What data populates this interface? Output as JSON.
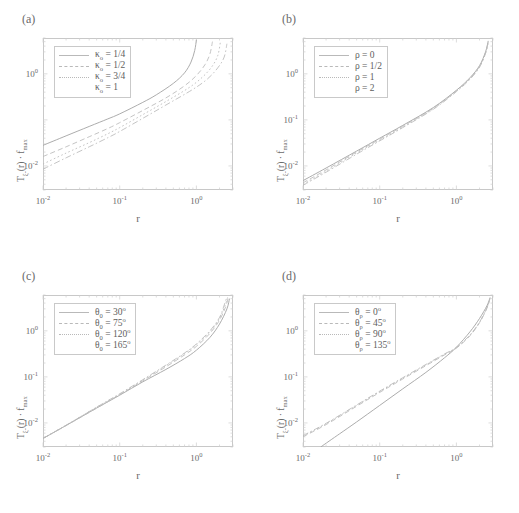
{
  "figure": {
    "background": "#ffffff",
    "line_color": "#b9b9b9",
    "solid_color": "#a8a8a8",
    "frame_color": "#c8c8c8"
  },
  "axis": {
    "xlabel": "r",
    "ylabel_prefix": "T",
    "ylabel_sub": "ξ-",
    "ylabel_mid": "(r) · f",
    "ylabel_sub2": "max",
    "xticks": [
      "10",
      "10",
      "10"
    ],
    "xtick_exp": [
      "-2",
      "-1",
      "0"
    ],
    "yticks": [
      "10",
      "10",
      "10"
    ],
    "ytick_exp": [
      "0",
      "-1",
      "-2"
    ]
  },
  "panels": [
    {
      "id": "a",
      "label": "(a)",
      "legend": [
        {
          "symbol": "κ",
          "sub": "o",
          "value": "1/4",
          "style": "solid"
        },
        {
          "symbol": "κ",
          "sub": "o",
          "value": "1/2",
          "style": "dashed"
        },
        {
          "symbol": "κ",
          "sub": "o",
          "value": "3/4",
          "style": "dotted"
        },
        {
          "symbol": "κ",
          "sub": "o",
          "value": "1",
          "style": "dashdot"
        }
      ],
      "show_ytick_minus1": false
    },
    {
      "id": "b",
      "label": "(b)",
      "legend": [
        {
          "symbol": "ρ",
          "sub": "",
          "value": "0",
          "style": "solid"
        },
        {
          "symbol": "ρ",
          "sub": "",
          "value": "1/2",
          "style": "dashed"
        },
        {
          "symbol": "ρ",
          "sub": "",
          "value": "1",
          "style": "dotted"
        },
        {
          "symbol": "ρ",
          "sub": "",
          "value": "2",
          "style": "dashdot"
        }
      ],
      "show_ytick_minus1": true
    },
    {
      "id": "c",
      "label": "(c)",
      "legend": [
        {
          "symbol": "θ",
          "sub": "0",
          "value": "30°",
          "style": "solid"
        },
        {
          "symbol": "θ",
          "sub": "0",
          "value": "75°",
          "style": "dashed"
        },
        {
          "symbol": "θ",
          "sub": "0",
          "value": "120°",
          "style": "dotted"
        },
        {
          "symbol": "θ",
          "sub": "0",
          "value": "165°",
          "style": "dashdot"
        }
      ],
      "show_ytick_minus1": true
    },
    {
      "id": "d",
      "label": "(d)",
      "legend": [
        {
          "symbol": "θ",
          "sub": "ρ",
          "value": "0°",
          "style": "solid"
        },
        {
          "symbol": "θ",
          "sub": "ρ",
          "value": "45°",
          "style": "dashed"
        },
        {
          "symbol": "θ",
          "sub": "ρ",
          "value": "90°",
          "style": "dotted"
        },
        {
          "symbol": "θ",
          "sub": "ρ",
          "value": "135°",
          "style": "dashdot"
        }
      ],
      "show_ytick_minus1": true
    }
  ],
  "chart_data": {
    "type": "line",
    "layout": "2x2 grid of log-log plots",
    "xlabel": "r",
    "ylabel": "T_ξ-(r) · f_max",
    "xscale": "log",
    "yscale": "log",
    "xlim": [
      0.01,
      3.0
    ],
    "ylim": [
      0.003,
      6.0
    ],
    "xticks": [
      0.01,
      0.1,
      1.0
    ],
    "yticks": [
      0.01,
      0.1,
      1.0
    ],
    "grid": false,
    "legend_position": "upper-left",
    "panels": [
      {
        "id": "a",
        "title": "(a)",
        "parameter": "kappa_0",
        "series": [
          {
            "name": "κ_o = 1/4",
            "style": "solid",
            "x": [
              0.01,
              0.02,
              0.04,
              0.07,
              0.1,
              0.2,
              0.3,
              0.5,
              0.7,
              0.85,
              0.95,
              1.0
            ],
            "y": [
              0.028,
              0.045,
              0.072,
              0.105,
              0.135,
              0.24,
              0.35,
              0.62,
              1.05,
              1.8,
              3.2,
              5.5
            ]
          },
          {
            "name": "κ_o = 1/2",
            "style": "dashed",
            "x": [
              0.01,
              0.02,
              0.04,
              0.07,
              0.1,
              0.2,
              0.4,
              0.7,
              1.0,
              1.3,
              1.5,
              1.62
            ],
            "y": [
              0.016,
              0.026,
              0.043,
              0.065,
              0.087,
              0.16,
              0.3,
              0.55,
              0.92,
              1.6,
              2.7,
              5.0
            ]
          },
          {
            "name": "κ_o = 3/4",
            "style": "dotted",
            "x": [
              0.01,
              0.02,
              0.04,
              0.07,
              0.1,
              0.2,
              0.4,
              0.8,
              1.2,
              1.6,
              1.9,
              2.05
            ],
            "y": [
              0.011,
              0.019,
              0.032,
              0.05,
              0.068,
              0.13,
              0.25,
              0.5,
              0.85,
              1.45,
              2.5,
              4.8
            ]
          },
          {
            "name": "κ_o = 1",
            "style": "dashdot",
            "x": [
              0.01,
              0.02,
              0.04,
              0.07,
              0.1,
              0.2,
              0.4,
              0.9,
              1.4,
              1.9,
              2.3,
              2.5
            ],
            "y": [
              0.0085,
              0.015,
              0.026,
              0.041,
              0.056,
              0.108,
              0.21,
              0.46,
              0.78,
              1.35,
              2.3,
              4.5
            ]
          }
        ]
      },
      {
        "id": "b",
        "title": "(b)",
        "parameter": "rho",
        "note": "four curves nearly coincident, slight separation at mid-r, all diverge near r=2.5",
        "series": [
          {
            "name": "ρ = 0",
            "style": "solid",
            "x": [
              0.01,
              0.02,
              0.05,
              0.1,
              0.2,
              0.5,
              1.0,
              1.5,
              2.0,
              2.4,
              2.6
            ],
            "y": [
              0.0048,
              0.009,
              0.021,
              0.04,
              0.076,
              0.185,
              0.44,
              0.82,
              1.5,
              3.0,
              5.2
            ]
          },
          {
            "name": "ρ = 1/2",
            "style": "dashed",
            "x": [
              0.01,
              0.02,
              0.05,
              0.1,
              0.2,
              0.5,
              1.0,
              1.5,
              2.0,
              2.4,
              2.6
            ],
            "y": [
              0.0043,
              0.0082,
              0.02,
              0.038,
              0.073,
              0.18,
              0.43,
              0.8,
              1.45,
              2.9,
              5.0
            ]
          },
          {
            "name": "ρ = 1",
            "style": "dotted",
            "x": [
              0.01,
              0.02,
              0.05,
              0.1,
              0.2,
              0.5,
              1.0,
              1.5,
              2.0,
              2.4,
              2.6
            ],
            "y": [
              0.004,
              0.0077,
              0.019,
              0.036,
              0.07,
              0.175,
              0.42,
              0.78,
              1.42,
              2.85,
              4.9
            ]
          },
          {
            "name": "ρ = 2",
            "style": "dashdot",
            "x": [
              0.01,
              0.02,
              0.05,
              0.1,
              0.2,
              0.5,
              1.0,
              1.5,
              2.0,
              2.4,
              2.6
            ],
            "y": [
              0.0038,
              0.0073,
              0.018,
              0.035,
              0.068,
              0.17,
              0.41,
              0.76,
              1.38,
              2.8,
              4.8
            ]
          }
        ]
      },
      {
        "id": "c",
        "title": "(c)",
        "parameter": "theta_0",
        "note": "curves coincide below r=0.2, separate above; solid (30°) lowest at large r",
        "series": [
          {
            "name": "θ_0 = 30°",
            "style": "solid",
            "x": [
              0.01,
              0.02,
              0.05,
              0.1,
              0.2,
              0.4,
              0.7,
              1.0,
              1.5,
              2.0,
              2.5,
              2.7
            ],
            "y": [
              0.0046,
              0.0088,
              0.021,
              0.04,
              0.078,
              0.145,
              0.25,
              0.38,
              0.72,
              1.4,
              3.0,
              5.0
            ]
          },
          {
            "name": "θ_0 = 75°",
            "style": "dashed",
            "x": [
              0.01,
              0.02,
              0.05,
              0.1,
              0.2,
              0.4,
              0.7,
              1.0,
              1.5,
              2.0,
              2.4,
              2.6
            ],
            "y": [
              0.0046,
              0.0088,
              0.021,
              0.041,
              0.082,
              0.165,
              0.3,
              0.46,
              0.88,
              1.7,
              3.3,
              5.2
            ]
          },
          {
            "name": "θ_0 = 120°",
            "style": "dotted",
            "x": [
              0.01,
              0.02,
              0.05,
              0.1,
              0.2,
              0.4,
              0.7,
              1.0,
              1.5,
              2.0,
              2.35,
              2.55
            ],
            "y": [
              0.0046,
              0.0089,
              0.022,
              0.042,
              0.085,
              0.175,
              0.32,
              0.5,
              0.95,
              1.85,
              3.5,
              5.3
            ]
          },
          {
            "name": "θ_0 = 165°",
            "style": "dashdot",
            "x": [
              0.01,
              0.02,
              0.05,
              0.1,
              0.2,
              0.4,
              0.7,
              1.0,
              1.5,
              2.0,
              2.3,
              2.5
            ],
            "y": [
              0.0046,
              0.0089,
              0.022,
              0.043,
              0.087,
              0.18,
              0.33,
              0.52,
              1.0,
              1.95,
              3.6,
              5.4
            ]
          }
        ]
      },
      {
        "id": "d",
        "title": "(d)",
        "parameter": "theta_rho",
        "note": "solid (0°) starts much lower, crosses the dashed group near r=1.2",
        "series": [
          {
            "name": "θ_ρ = 0°",
            "style": "solid",
            "x": [
              0.017,
              0.03,
              0.05,
              0.1,
              0.2,
              0.4,
              0.7,
              1.0,
              1.5,
              2.0,
              2.5,
              2.75
            ],
            "y": [
              0.003,
              0.0058,
              0.0105,
              0.024,
              0.055,
              0.125,
              0.26,
              0.44,
              0.95,
              1.85,
              3.5,
              5.3
            ]
          },
          {
            "name": "θ_ρ = 45°",
            "style": "dashed",
            "x": [
              0.01,
              0.02,
              0.05,
              0.1,
              0.2,
              0.4,
              0.7,
              1.0,
              1.5,
              2.0,
              2.5,
              2.75
            ],
            "y": [
              0.005,
              0.0092,
              0.023,
              0.046,
              0.09,
              0.175,
              0.3,
              0.42,
              0.78,
              1.5,
              3.1,
              5.1
            ]
          },
          {
            "name": "θ_ρ = 90°",
            "style": "dotted",
            "x": [
              0.01,
              0.02,
              0.05,
              0.1,
              0.2,
              0.4,
              0.7,
              1.0,
              1.5,
              2.0,
              2.5,
              2.75
            ],
            "y": [
              0.0052,
              0.0096,
              0.024,
              0.048,
              0.094,
              0.182,
              0.31,
              0.43,
              0.8,
              1.52,
              3.15,
              5.15
            ]
          },
          {
            "name": "θ_ρ = 135°",
            "style": "dashdot",
            "x": [
              0.01,
              0.02,
              0.05,
              0.1,
              0.2,
              0.4,
              0.7,
              1.0,
              1.5,
              2.0,
              2.5,
              2.75
            ],
            "y": [
              0.0053,
              0.0098,
              0.0245,
              0.049,
              0.096,
              0.186,
              0.315,
              0.435,
              0.81,
              1.54,
              3.18,
              5.18
            ]
          }
        ]
      }
    ]
  }
}
